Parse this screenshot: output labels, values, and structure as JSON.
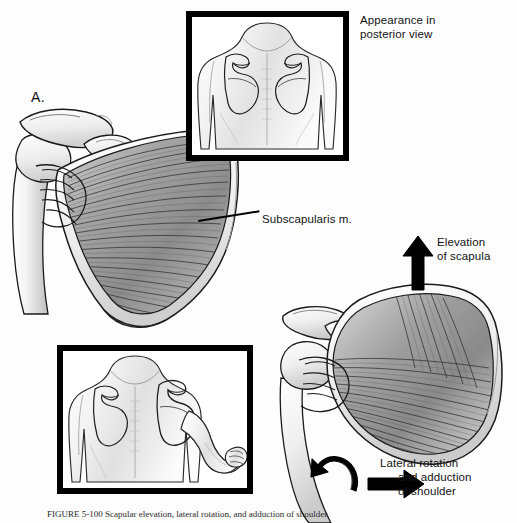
{
  "figure": {
    "panel_a_letter": "A.",
    "panel_b_letter": "B.",
    "caption": "FIGURE 5-100  Scapular elevation, lateral rotation, and adduction of shoulder."
  },
  "labels": {
    "appearance_line1": "Appearance in",
    "appearance_line2": "posterior view",
    "subscapularis": "Subscapularis m.",
    "elevation_line1": "Elevation",
    "elevation_line2": "of scapula",
    "action_line1": "Lateral rotation",
    "action_line2": "and adduction",
    "action_line3": "of shoulder"
  },
  "insets": {
    "top": {
      "name": "posterior-view-neutral",
      "description": "Posterior view of upper back with both scapulae outlined in neutral position"
    },
    "bottom": {
      "name": "posterior-view-action",
      "description": "Posterior view of upper back with right arm laterally rotated and adducted, scapula elevated"
    }
  },
  "panels": {
    "a": {
      "name": "subscapularis-anterior-scapula",
      "description": "Anterior (costal) surface of right scapula showing subscapularis muscle fibers converging toward the humerus"
    },
    "b": {
      "name": "subscapularis-action",
      "description": "Scapula elevated and laterally rotated with subscapularis acting on humerus"
    }
  },
  "arrows": {
    "elevation": "up-arrow",
    "adduction": "right-arrow",
    "rotation": "curved-rotation-arrow"
  },
  "colors": {
    "ink": "#141414",
    "box_border": "#000000",
    "page": "#fdfdfd",
    "muscle_mid": "#9a9a9a",
    "bone_light": "#efefef"
  }
}
